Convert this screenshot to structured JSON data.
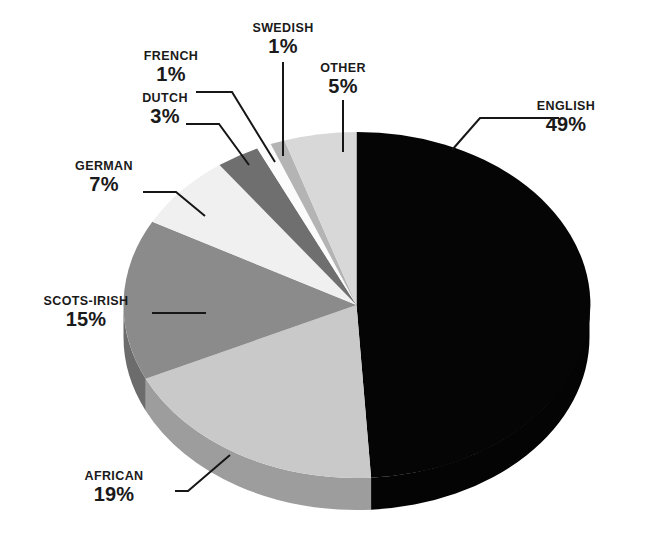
{
  "chart_data": {
    "type": "pie",
    "title": "",
    "subtitle": "",
    "xlabel": "",
    "ylabel": "",
    "legend_position": "callout-labels",
    "grid": false,
    "units": "percent",
    "total": 100,
    "categories": [
      "ENGLISH",
      "AFRICAN",
      "SCOTS-IRISH",
      "GERMAN",
      "DUTCH",
      "FRENCH",
      "SWEDISH",
      "OTHER"
    ],
    "values": [
      49,
      19,
      15,
      7,
      3,
      1,
      1,
      5
    ],
    "slices": [
      {
        "label": "ENGLISH",
        "value": 49,
        "value_text": "49%",
        "color": "#050505"
      },
      {
        "label": "AFRICAN",
        "value": 19,
        "value_text": "19%",
        "color": "#c9c9c9"
      },
      {
        "label": "SCOTS-IRISH",
        "value": 15,
        "value_text": "15%",
        "color": "#8b8b8b"
      },
      {
        "label": "GERMAN",
        "value": 7,
        "value_text": "7%",
        "color": "#f0f0f0"
      },
      {
        "label": "DUTCH",
        "value": 3,
        "value_text": "3%",
        "color": "#6f6f6f"
      },
      {
        "label": "FRENCH",
        "value": 1,
        "value_text": "1%",
        "color": "#fbfbfb"
      },
      {
        "label": "SWEDISH",
        "value": 1,
        "value_text": "1%",
        "color": "#b4b4b4"
      },
      {
        "label": "OTHER",
        "value": 5,
        "value_text": "5%",
        "color": "#d8d8d8"
      }
    ]
  },
  "labels": {
    "english": {
      "name": "ENGLISH",
      "value": "49%"
    },
    "other": {
      "name": "OTHER",
      "value": "5%"
    },
    "swedish": {
      "name": "SWEDISH",
      "value": "1%"
    },
    "french": {
      "name": "FRENCH",
      "value": "1%"
    },
    "dutch": {
      "name": "DUTCH",
      "value": "3%"
    },
    "german": {
      "name": "GERMAN",
      "value": "7%"
    },
    "scots_irish": {
      "name": "SCOTS-IRISH",
      "value": "15%"
    },
    "african": {
      "name": "AFRICAN",
      "value": "19%"
    }
  },
  "colors": {
    "background": "#ffffff",
    "text": "#1a1a1a",
    "leader_line": "#161616"
  }
}
